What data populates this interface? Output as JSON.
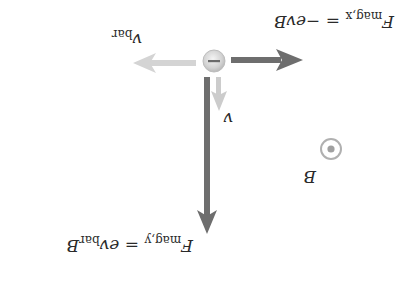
{
  "diagram": {
    "orientation": "rotated-180",
    "particle": {
      "symbol": "–",
      "label": "electron",
      "charge": "negative"
    },
    "vectors": {
      "v": {
        "label": "v",
        "color": "#c9c9c9"
      },
      "v_bar": {
        "label": "v",
        "subscript": "bar",
        "color": "#cfcfcf"
      },
      "f_mag_x": {
        "label": "F",
        "subscript": "mag,x",
        "equals": " = −evB",
        "color": "#6e6e6e"
      },
      "f_mag_y": {
        "label": "F",
        "subscript": "mag,y",
        "equals": " = ev",
        "equals_sub": "bar",
        "equals_tail": "B",
        "color": "#6e6e6e"
      }
    },
    "field": {
      "label": "B",
      "symbol": "out-of-page",
      "color": "#a8a8a8"
    }
  }
}
